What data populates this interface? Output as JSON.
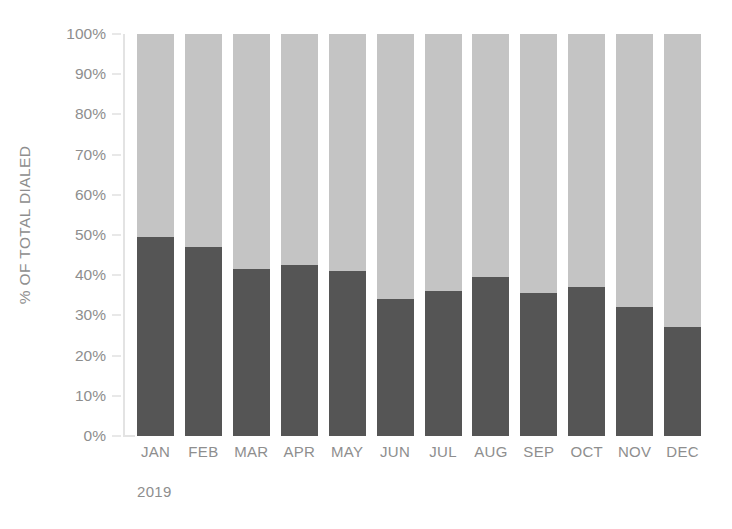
{
  "chart_data": {
    "type": "bar",
    "subtype": "stacked-100-percent",
    "title": "",
    "xlabel": "2019",
    "ylabel": "% OF TOTAL DIALED",
    "categories": [
      "JAN",
      "FEB",
      "MAR",
      "APR",
      "MAY",
      "JUN",
      "JUL",
      "AUG",
      "SEP",
      "OCT",
      "NOV",
      "DEC"
    ],
    "ylim": [
      0,
      100
    ],
    "ytick_labels": [
      "0%",
      "10%",
      "20%",
      "30%",
      "40%",
      "50%",
      "60%",
      "70%",
      "80%",
      "90%",
      "100%"
    ],
    "ytick_values": [
      0,
      10,
      20,
      30,
      40,
      50,
      60,
      70,
      80,
      90,
      100
    ],
    "grid": false,
    "legend": "none",
    "series": [
      {
        "name": "bottom-segment",
        "color": "#555555",
        "values": [
          49.5,
          47.0,
          41.5,
          42.5,
          41.0,
          34.0,
          36.0,
          39.5,
          35.5,
          37.0,
          32.0,
          27.0
        ]
      },
      {
        "name": "top-segment",
        "color": "#c4c4c4",
        "values": [
          50.5,
          53.0,
          58.5,
          57.5,
          59.0,
          66.0,
          64.0,
          60.5,
          64.5,
          63.0,
          68.0,
          73.0
        ]
      }
    ],
    "annotations": []
  },
  "axis": {
    "y_title": "% OF TOTAL DIALED",
    "x_period": "2019"
  },
  "colors": {
    "dark_segment": "#555555",
    "light_segment": "#c4c4c4",
    "axis_line": "#e3e3e3",
    "tick": "#d2d2d2",
    "text": "#8e8e8e",
    "background": "#ffffff"
  }
}
